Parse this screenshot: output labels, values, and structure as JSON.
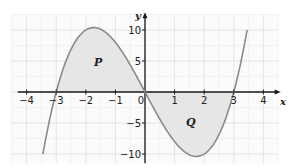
{
  "chart_data": {
    "type": "line",
    "title": "",
    "function": "y = x^3 - 9x",
    "xlabel": "x",
    "ylabel": "y",
    "xlim": [
      -4.5,
      4.5
    ],
    "ylim": [
      -12,
      12.5
    ],
    "x_ticks": [
      -4,
      -3,
      -2,
      -1,
      0,
      1,
      2,
      3,
      4
    ],
    "x_tick_labels": [
      "−4",
      "−3",
      "−2",
      "−1",
      "0",
      "1",
      "2",
      "3",
      "4"
    ],
    "y_ticks": [
      -10,
      -5,
      5,
      10
    ],
    "y_tick_labels": [
      "−10",
      "−5",
      "5",
      "10"
    ],
    "grid": true,
    "curve_domain": [
      -3.45,
      3.45
    ],
    "series": [
      {
        "name": "y = x^3 - 9x",
        "x": [
          -3.45,
          -3,
          -2.5,
          -2,
          -1.73,
          -1.5,
          -1,
          -0.5,
          0,
          0.5,
          1,
          1.5,
          1.73,
          2,
          2.5,
          3,
          3.45
        ],
        "y": [
          -10.0,
          0,
          6.9,
          10,
          10.4,
          10.1,
          8,
          4.4,
          0,
          -4.4,
          -8,
          -10.1,
          -10.4,
          -10,
          -6.9,
          0,
          10.0
        ]
      }
    ],
    "shaded_regions": [
      {
        "label": "P",
        "from": -3,
        "to": 0,
        "position": "above x-axis"
      },
      {
        "label": "Q",
        "from": 0,
        "to": 3,
        "position": "below x-axis"
      }
    ],
    "colors": {
      "curve": "#8a8a8a",
      "shade": "#e6e6e6",
      "grid": "#e4e4e4",
      "axis": "#1a1a1a"
    }
  },
  "labels": {
    "region_p": "P",
    "region_q": "Q",
    "x_axis": "x",
    "y_axis": "y",
    "origin": "0"
  }
}
